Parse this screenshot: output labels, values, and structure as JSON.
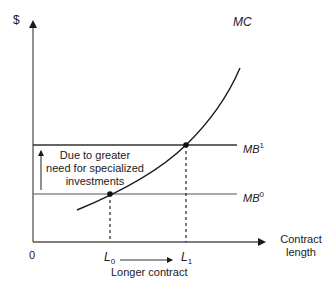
{
  "diagram": {
    "y_axis_label": "$",
    "x_axis_label_line1": "Contract",
    "x_axis_label_line2": "length",
    "origin_label": "0",
    "curves": {
      "mc": {
        "label": "MC"
      },
      "mb1": {
        "label": "MB",
        "superscript": "1"
      },
      "mb0": {
        "label": "MB",
        "superscript": "0"
      }
    },
    "x_markers": {
      "l0": {
        "label": "L",
        "subscript": "0"
      },
      "l1": {
        "label": "L",
        "subscript": "1"
      }
    },
    "shift_annotation": {
      "line1": "Due to greater",
      "line2": "need for specialized",
      "line3": "investments"
    },
    "bottom_annotation": "Longer contract"
  }
}
